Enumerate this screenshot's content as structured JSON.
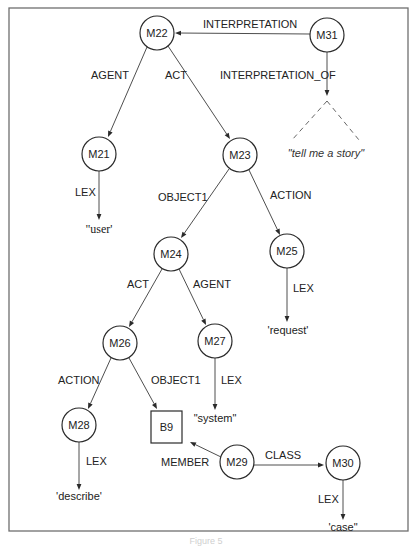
{
  "figure": {
    "frame": {
      "x": 9,
      "y": 8,
      "width": 399,
      "height": 523,
      "stroke": "#6f6f6f"
    },
    "caption": "Figure 5"
  },
  "nodes": [
    {
      "id": "M22",
      "label": "M22",
      "shape": "circle",
      "cx": 157,
      "cy": 33,
      "r": 17
    },
    {
      "id": "M31",
      "label": "M31",
      "shape": "circle",
      "cx": 327,
      "cy": 35,
      "r": 17
    },
    {
      "id": "M21",
      "label": "M21",
      "shape": "circle",
      "cx": 99,
      "cy": 154,
      "r": 17
    },
    {
      "id": "M23",
      "label": "M23",
      "shape": "circle",
      "cx": 240,
      "cy": 155,
      "r": 17
    },
    {
      "id": "M24",
      "label": "M24",
      "shape": "circle",
      "cx": 171,
      "cy": 254,
      "r": 17
    },
    {
      "id": "M25",
      "label": "M25",
      "shape": "circle",
      "cx": 287,
      "cy": 251,
      "r": 17
    },
    {
      "id": "M26",
      "label": "M26",
      "shape": "circle",
      "cx": 120,
      "cy": 343,
      "r": 17
    },
    {
      "id": "M27",
      "label": "M27",
      "shape": "circle",
      "cx": 215,
      "cy": 341,
      "r": 17
    },
    {
      "id": "M28",
      "label": "M28",
      "shape": "circle",
      "cx": 79,
      "cy": 425,
      "r": 17
    },
    {
      "id": "B9",
      "label": "B9",
      "shape": "box",
      "x": 151,
      "y": 411,
      "w": 31,
      "h": 32
    },
    {
      "id": "M29",
      "label": "M29",
      "shape": "circle",
      "cx": 237,
      "cy": 462,
      "r": 17
    },
    {
      "id": "M30",
      "label": "M30",
      "shape": "circle",
      "cx": 343,
      "cy": 463,
      "r": 17
    }
  ],
  "lexicals": [
    {
      "id": "lex-user",
      "text": "\"user'",
      "x": 99,
      "y": 233,
      "style": "serif"
    },
    {
      "id": "lex-request",
      "text": "'request'",
      "x": 288,
      "y": 334,
      "style": "sans"
    },
    {
      "id": "lex-system",
      "text": "\"system\"",
      "x": 215,
      "y": 422,
      "style": "sans"
    },
    {
      "id": "lex-describe",
      "text": "'describe'",
      "x": 79,
      "y": 500,
      "style": "sans"
    },
    {
      "id": "lex-case",
      "text": "'case\"",
      "x": 343,
      "y": 531,
      "style": "sans"
    },
    {
      "id": "lex-tell-me-a-story",
      "text": "\"tell me a story\"",
      "x": 326,
      "y": 157,
      "style": "italic"
    }
  ],
  "edges": [
    {
      "id": "e-interpretation",
      "label": "INTERPRETATION",
      "x1": 310,
      "y1": 34,
      "x2": 175,
      "y2": 33,
      "lx": 203,
      "ly": 28
    },
    {
      "id": "e-interpretation-of",
      "label": "INTERPRETATION_OF",
      "x1": 327,
      "y1": 52,
      "x2": 327,
      "y2": 96,
      "lx": 220,
      "ly": 79
    },
    {
      "id": "e-m22-agent",
      "label": "AGENT",
      "x1": 147,
      "y1": 47,
      "x2": 108,
      "y2": 137,
      "lx": 91,
      "ly": 79
    },
    {
      "id": "e-m22-act",
      "label": "ACT",
      "x1": 168,
      "y1": 46,
      "x2": 230,
      "y2": 139,
      "lx": 165,
      "ly": 79
    },
    {
      "id": "e-m21-lex",
      "label": "LEX",
      "x1": 99,
      "y1": 171,
      "x2": 99,
      "y2": 220,
      "lx": 75,
      "ly": 196
    },
    {
      "id": "e-m23-object1",
      "label": "OBJECT1",
      "x1": 229,
      "y1": 169,
      "x2": 181,
      "y2": 238,
      "lx": 158,
      "ly": 201
    },
    {
      "id": "e-m23-action",
      "label": "ACTION",
      "x1": 249,
      "y1": 170,
      "x2": 280,
      "y2": 235,
      "lx": 270,
      "ly": 199
    },
    {
      "id": "e-m25-lex",
      "label": "LEX",
      "x1": 287,
      "y1": 268,
      "x2": 287,
      "y2": 322,
      "lx": 293,
      "ly": 292
    },
    {
      "id": "e-m24-act",
      "label": "ACT",
      "x1": 162,
      "y1": 269,
      "x2": 129,
      "y2": 327,
      "lx": 127,
      "ly": 288
    },
    {
      "id": "e-m24-agent",
      "label": "AGENT",
      "x1": 179,
      "y1": 269,
      "x2": 206,
      "y2": 325,
      "lx": 193,
      "ly": 288
    },
    {
      "id": "e-m26-action",
      "label": "ACTION",
      "x1": 111,
      "y1": 358,
      "x2": 88,
      "y2": 409,
      "lx": 58,
      "ly": 384
    },
    {
      "id": "e-m26-object1",
      "label": "OBJECT1",
      "x1": 129,
      "y1": 358,
      "x2": 157,
      "y2": 409,
      "lx": 151,
      "ly": 384
    },
    {
      "id": "e-m27-lex",
      "label": "LEX",
      "x1": 215,
      "y1": 358,
      "x2": 215,
      "y2": 410,
      "lx": 221,
      "ly": 384
    },
    {
      "id": "e-m28-lex",
      "label": "LEX",
      "x1": 79,
      "y1": 442,
      "x2": 79,
      "y2": 490,
      "lx": 86,
      "ly": 465
    },
    {
      "id": "e-member",
      "label": "MEMBER",
      "x1": 221,
      "y1": 457,
      "x2": 190,
      "y2": 442,
      "lx": 161,
      "ly": 466
    },
    {
      "id": "e-class",
      "label": "CLASS",
      "x1": 254,
      "y1": 465,
      "x2": 324,
      "y2": 465,
      "lx": 265,
      "ly": 459
    },
    {
      "id": "e-m30-lex",
      "label": "LEX",
      "x1": 343,
      "y1": 480,
      "x2": 343,
      "y2": 520,
      "lx": 318,
      "ly": 503
    }
  ],
  "dashed_triangle": {
    "apex_x": 327,
    "apex_y": 101,
    "left_x": 292,
    "left_y": 140,
    "right_x": 359,
    "right_y": 140
  }
}
